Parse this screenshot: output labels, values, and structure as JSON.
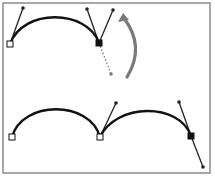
{
  "diagram": {
    "colors": {
      "background": "#ffffff",
      "frame": "#8a8a8a",
      "path": "#111111",
      "handle": "#222222",
      "dotted_handle": "#777777",
      "arrow": "#7a7a7a",
      "anchor_fill_open": "#ffffff",
      "anchor_fill_selected": "#111111"
    },
    "frame": {
      "x": 3,
      "y": 3,
      "width": 207,
      "height": 170
    },
    "top": {
      "segment": {
        "from": [
          10,
          44
        ],
        "c1": [
          23,
          8
        ],
        "c2": [
          87,
          9
        ],
        "to": [
          99,
          43
        ]
      },
      "anchors": [
        {
          "name": "start-anchor",
          "x": 10,
          "y": 44,
          "selected": false
        },
        {
          "name": "corner-anchor",
          "x": 99,
          "y": 43,
          "selected": true
        }
      ],
      "handles": [
        {
          "name": "start-handle",
          "from": [
            10,
            44
          ],
          "to": [
            23,
            8
          ],
          "style": "solid"
        },
        {
          "name": "incoming-handle",
          "from": [
            99,
            43
          ],
          "to": [
            87,
            9
          ],
          "style": "solid"
        },
        {
          "name": "rotated-handle",
          "from": [
            99,
            43
          ],
          "to": [
            113,
            10
          ],
          "style": "solid"
        },
        {
          "name": "original-handle",
          "from": [
            99,
            43
          ],
          "to": [
            111,
            74
          ],
          "style": "dotted"
        }
      ],
      "arrow": {
        "from": [
          127,
          77
        ],
        "control": [
          146,
          46
        ],
        "to": [
          123,
          13
        ]
      }
    },
    "bottom": {
      "segments": [
        {
          "from": [
            12,
            137
          ],
          "c1": [
            22,
            100
          ],
          "c2": [
            90,
            100
          ],
          "to": [
            100,
            137
          ]
        },
        {
          "from": [
            100,
            137
          ],
          "c1": [
            116,
            103
          ],
          "c2": [
            179,
            102
          ],
          "to": [
            191,
            136
          ]
        }
      ],
      "anchors": [
        {
          "name": "start-anchor",
          "x": 12,
          "y": 137,
          "selected": false
        },
        {
          "name": "corner-anchor",
          "x": 100,
          "y": 137,
          "selected": false
        },
        {
          "name": "end-anchor",
          "x": 191,
          "y": 136,
          "selected": true
        }
      ],
      "handles": [
        {
          "name": "corner-out-handle",
          "from": [
            100,
            137
          ],
          "to": [
            116,
            103
          ],
          "style": "solid"
        },
        {
          "name": "end-in-handle",
          "from": [
            191,
            136
          ],
          "to": [
            179,
            102
          ],
          "style": "solid"
        },
        {
          "name": "end-out-handle",
          "from": [
            191,
            136
          ],
          "to": [
            203,
            167
          ],
          "style": "solid"
        }
      ]
    }
  }
}
